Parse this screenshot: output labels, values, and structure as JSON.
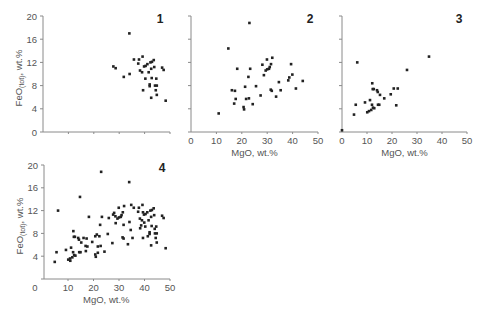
{
  "chart_data": [
    {
      "type": "scatter",
      "panel": "1",
      "xlabel": "",
      "ylabel": "FeO(tot), wt.%",
      "ylabel_main": "FeO",
      "ylabel_sub": "(tot)",
      "ylabel_tail": ", wt.%",
      "xlim": [
        0,
        50
      ],
      "ylim": [
        0,
        20
      ],
      "xticks": [],
      "yticks": [
        0,
        4,
        8,
        12,
        16,
        20
      ],
      "x": [
        34.0,
        27.7,
        28.6,
        31.8,
        34.1,
        35.8,
        37.8,
        37.5,
        38.2,
        39.2,
        39.0,
        39.8,
        40.4,
        41.1,
        40.3,
        41.6,
        42.3,
        42.9,
        43.6,
        43.8,
        42.6,
        42.0,
        42.0,
        42.8,
        44.6,
        44.1,
        44.8,
        44.4,
        44.8,
        42.6,
        39.4,
        46.9,
        47.5,
        48.3
      ],
      "y": [
        17.0,
        11.3,
        11.0,
        9.5,
        10.0,
        12.5,
        12.5,
        11.8,
        10.6,
        13.0,
        10.3,
        11.3,
        11.4,
        11.7,
        9.2,
        10.3,
        12.0,
        12.1,
        12.4,
        11.2,
        10.9,
        8.2,
        7.9,
        9.3,
        9.2,
        8.0,
        8.0,
        7.2,
        6.4,
        5.9,
        7.2,
        11.1,
        10.7,
        5.4
      ]
    },
    {
      "type": "scatter",
      "panel": "2",
      "xlabel": "MgO, wt.%",
      "ylabel": "",
      "xlim": [
        0,
        50
      ],
      "ylim": [
        0,
        20
      ],
      "xticks": [
        0,
        10,
        20,
        30,
        40,
        50
      ],
      "yticks": [],
      "x": [
        23.0,
        14.7,
        18.2,
        22.6,
        23.3,
        16.1,
        17.3,
        21.3,
        17.6,
        17.0,
        21.7,
        22.8,
        20.7,
        20.9,
        24.3,
        25.6,
        27.4,
        28.1,
        28.7,
        29.4,
        30.0,
        29.9,
        30.7,
        31.0,
        31.5,
        32.0,
        31.4,
        31.8,
        33.5,
        34.6,
        35.3,
        38.3,
        38.7,
        39.4,
        39.9,
        41.3,
        44.0,
        10.9
      ],
      "y": [
        18.8,
        14.4,
        10.9,
        9.5,
        10.9,
        7.2,
        7.1,
        7.8,
        5.7,
        4.9,
        5.7,
        5.8,
        4.3,
        3.9,
        4.8,
        7.9,
        6.3,
        11.6,
        9.8,
        10.6,
        10.8,
        12.5,
        10.9,
        11.2,
        11.7,
        12.8,
        7.3,
        7.1,
        6.1,
        8.6,
        7.2,
        8.9,
        9.4,
        11.7,
        9.9,
        7.5,
        8.8,
        3.2
      ]
    },
    {
      "type": "scatter",
      "panel": "3",
      "xlabel": "MgO, wt.%",
      "ylabel": "",
      "xlim": [
        0,
        50
      ],
      "ylim": [
        0,
        20
      ],
      "xticks": [
        0,
        10,
        20,
        30,
        40,
        50
      ],
      "yticks": [],
      "x": [
        0.0,
        6.1,
        4.8,
        5.5,
        9.2,
        10.1,
        10.8,
        11.2,
        12.1,
        12.3,
        12.7,
        12.0,
        11.7,
        12.4,
        12.9,
        14.0,
        14.3,
        14.4,
        14.9,
        15.2,
        16.9,
        19.5,
        20.7,
        21.7,
        22.3,
        26.0,
        34.8
      ],
      "y": [
        0.3,
        12.0,
        3.0,
        4.7,
        5.1,
        3.4,
        3.6,
        5.5,
        8.4,
        7.4,
        7.4,
        4.7,
        3.8,
        4.2,
        4.1,
        7.2,
        6.9,
        4.7,
        4.7,
        6.4,
        5.8,
        6.5,
        7.5,
        4.6,
        7.5,
        10.7,
        13.0
      ]
    },
    {
      "type": "scatter",
      "panel": "4",
      "xlabel": "MgO, wt.%",
      "ylabel": "FeO(tot), wt.%",
      "ylabel_main": "FeO",
      "ylabel_sub": "(tot)",
      "ylabel_tail": ", wt.%",
      "xlim": [
        0,
        50
      ],
      "ylim": [
        0,
        20
      ],
      "xticks": [
        0,
        10,
        20,
        30,
        40,
        50
      ],
      "yticks": [
        4,
        8,
        12,
        16,
        20
      ],
      "combined_from_panels": [
        "1",
        "2",
        "3"
      ]
    }
  ],
  "panels": [
    {
      "label": "1"
    },
    {
      "label": "2"
    },
    {
      "label": "3"
    },
    {
      "label": "4"
    }
  ]
}
